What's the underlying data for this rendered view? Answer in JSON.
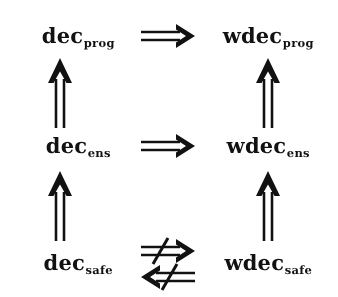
{
  "figure": {
    "kind": "implication-diagram",
    "background_color": "#ffffff",
    "ink_color": "#141414",
    "rows": 3,
    "columns": 2
  },
  "nodes": {
    "dec_prog": {
      "base": "dec",
      "subscript": "prog",
      "row": "top",
      "column": "left"
    },
    "wdec_prog": {
      "base": "wdec",
      "subscript": "prog",
      "row": "top",
      "column": "right"
    },
    "dec_ens": {
      "base": "dec",
      "subscript": "ens",
      "row": "middle",
      "column": "left"
    },
    "wdec_ens": {
      "base": "wdec",
      "subscript": "ens",
      "row": "middle",
      "column": "right"
    },
    "dec_safe": {
      "base": "dec",
      "subscript": "safe",
      "row": "bottom",
      "column": "left"
    },
    "wdec_safe": {
      "base": "wdec",
      "subscript": "safe",
      "row": "bottom",
      "column": "right"
    }
  },
  "arrows": {
    "prog_implies": {
      "glyph": "⟹",
      "name": "implies-right",
      "from": "dec_prog",
      "to": "wdec_prog",
      "negated": false
    },
    "ens_implies": {
      "glyph": "⟹",
      "name": "implies-right",
      "from": "dec_ens",
      "to": "wdec_ens",
      "negated": false
    },
    "safe_not_implies_right": {
      "glyph": "⇏",
      "name": "not-implies-right",
      "from": "dec_safe",
      "to": "wdec_safe",
      "negated": true
    },
    "safe_not_implies_left": {
      "glyph": "⇍",
      "name": "not-implies-left",
      "from": "wdec_safe",
      "to": "dec_safe",
      "negated": true
    },
    "left_ens_to_prog": {
      "glyph": "⇑",
      "name": "implies-up",
      "from": "dec_ens",
      "to": "dec_prog",
      "negated": false
    },
    "right_ens_to_prog": {
      "glyph": "⇑",
      "name": "implies-up",
      "from": "wdec_ens",
      "to": "wdec_prog",
      "negated": false
    },
    "left_safe_to_ens": {
      "glyph": "⇑",
      "name": "implies-up",
      "from": "dec_safe",
      "to": "dec_ens",
      "negated": false
    },
    "right_safe_to_ens": {
      "glyph": "⇑",
      "name": "implies-up",
      "from": "wdec_safe",
      "to": "wdec_ens",
      "negated": false
    }
  }
}
